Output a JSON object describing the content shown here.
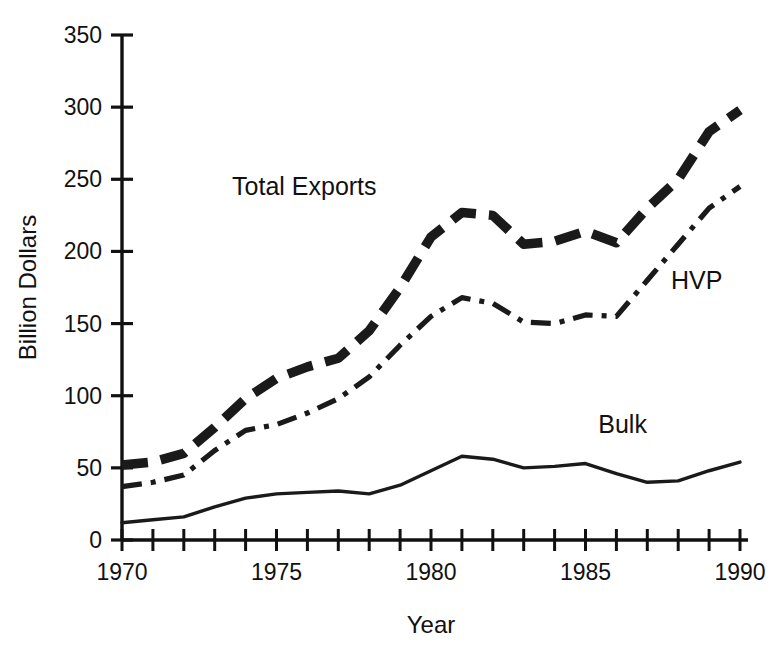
{
  "chart_data": {
    "type": "line",
    "title": "",
    "xlabel": "Year",
    "ylabel": "Billion Dollars",
    "xlim": [
      1970,
      1990
    ],
    "ylim": [
      0,
      350
    ],
    "grid": false,
    "legend_position": "inline-annotations",
    "x": [
      1970,
      1971,
      1972,
      1973,
      1974,
      1975,
      1976,
      1977,
      1978,
      1979,
      1980,
      1981,
      1982,
      1983,
      1984,
      1985,
      1986,
      1987,
      1988,
      1989,
      1990
    ],
    "y_ticks": [
      0,
      50,
      100,
      150,
      200,
      250,
      300,
      350
    ],
    "y_tick_labels": [
      "0",
      "50",
      "100",
      "150",
      "200",
      "250",
      "300",
      "350"
    ],
    "x_ticks": [
      1970,
      1971,
      1972,
      1973,
      1974,
      1975,
      1976,
      1977,
      1978,
      1979,
      1980,
      1981,
      1982,
      1983,
      1984,
      1985,
      1986,
      1987,
      1988,
      1989,
      1990
    ],
    "x_tick_labels": [
      "1970",
      "",
      "",
      "",
      "",
      "1975",
      "",
      "",
      "",
      "",
      "1980",
      "",
      "",
      "",
      "",
      "1985",
      "",
      "",
      "",
      "",
      "1990"
    ],
    "x_labeled_ticks": [
      "1970",
      "1975",
      "1980",
      "1985",
      "1990"
    ],
    "series": [
      {
        "name": "Total Exports",
        "style": "bold-dashed",
        "values": [
          52,
          54,
          60,
          78,
          98,
          112,
          120,
          126,
          145,
          175,
          210,
          227,
          225,
          205,
          207,
          214,
          206,
          230,
          250,
          283,
          298
        ]
      },
      {
        "name": "HVP",
        "style": "dash-dot",
        "values": [
          37,
          40,
          45,
          62,
          76,
          80,
          88,
          98,
          113,
          135,
          155,
          168,
          164,
          151,
          150,
          156,
          155,
          180,
          205,
          230,
          245
        ]
      },
      {
        "name": "Bulk",
        "style": "solid",
        "values": [
          12,
          14,
          16,
          23,
          29,
          32,
          33,
          34,
          32,
          38,
          48,
          58,
          56,
          50,
          51,
          53,
          46,
          40,
          41,
          48,
          54
        ]
      }
    ]
  },
  "annotations": [
    {
      "name": "Total Exports",
      "x": 1975.9,
      "y": 239
    },
    {
      "name": "HVP",
      "x": 1988.6,
      "y": 174
    },
    {
      "name": "Bulk",
      "x": 1986.2,
      "y": 74
    }
  ]
}
